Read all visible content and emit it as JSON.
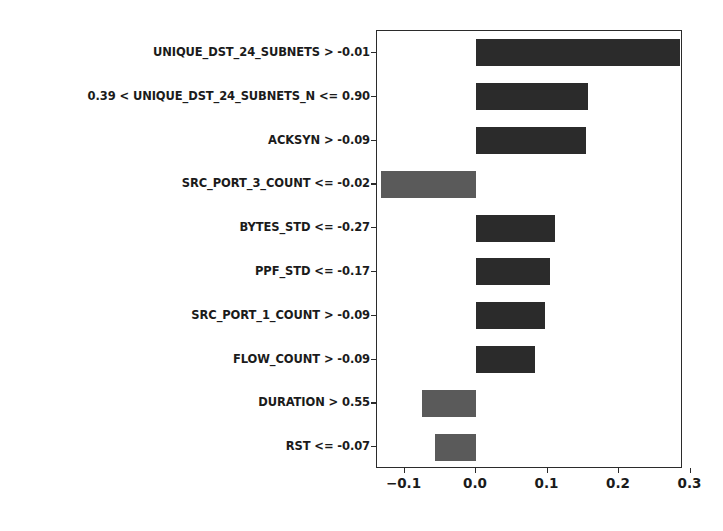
{
  "chart_data": {
    "type": "bar",
    "orientation": "horizontal",
    "title": "",
    "xlabel": "",
    "ylabel": "",
    "categories": [
      "UNIQUE_DST_24_SUBNETS > -0.01",
      "0.39 < UNIQUE_DST_24_SUBNETS_N <= 0.90",
      "ACKSYN > -0.09",
      "SRC_PORT_3_COUNT <= -0.02",
      "BYTES_STD <= -0.27",
      "PPF_STD <= -0.17",
      "SRC_PORT_1_COUNT > -0.09",
      "FLOW_COUNT > -0.09",
      "DURATION > 0.55",
      "RST <= -0.07"
    ],
    "values": [
      0.285,
      0.157,
      0.154,
      -0.133,
      0.11,
      0.103,
      0.097,
      0.083,
      -0.076,
      -0.057
    ],
    "xlim": [
      -0.1385,
      0.2895
    ],
    "xticks": [
      -0.1,
      0.0,
      0.1,
      0.2,
      0.3
    ],
    "xticklabels": [
      "−0.1",
      "0.0",
      "0.1",
      "0.2",
      "0.3"
    ],
    "grid": false,
    "legend": null,
    "colors": {
      "positive": "#2b2b2b",
      "negative": "#5a5a5a",
      "axis": "#2b2b2b",
      "background": "#ffffff",
      "text": "#1b1b1b"
    }
  }
}
